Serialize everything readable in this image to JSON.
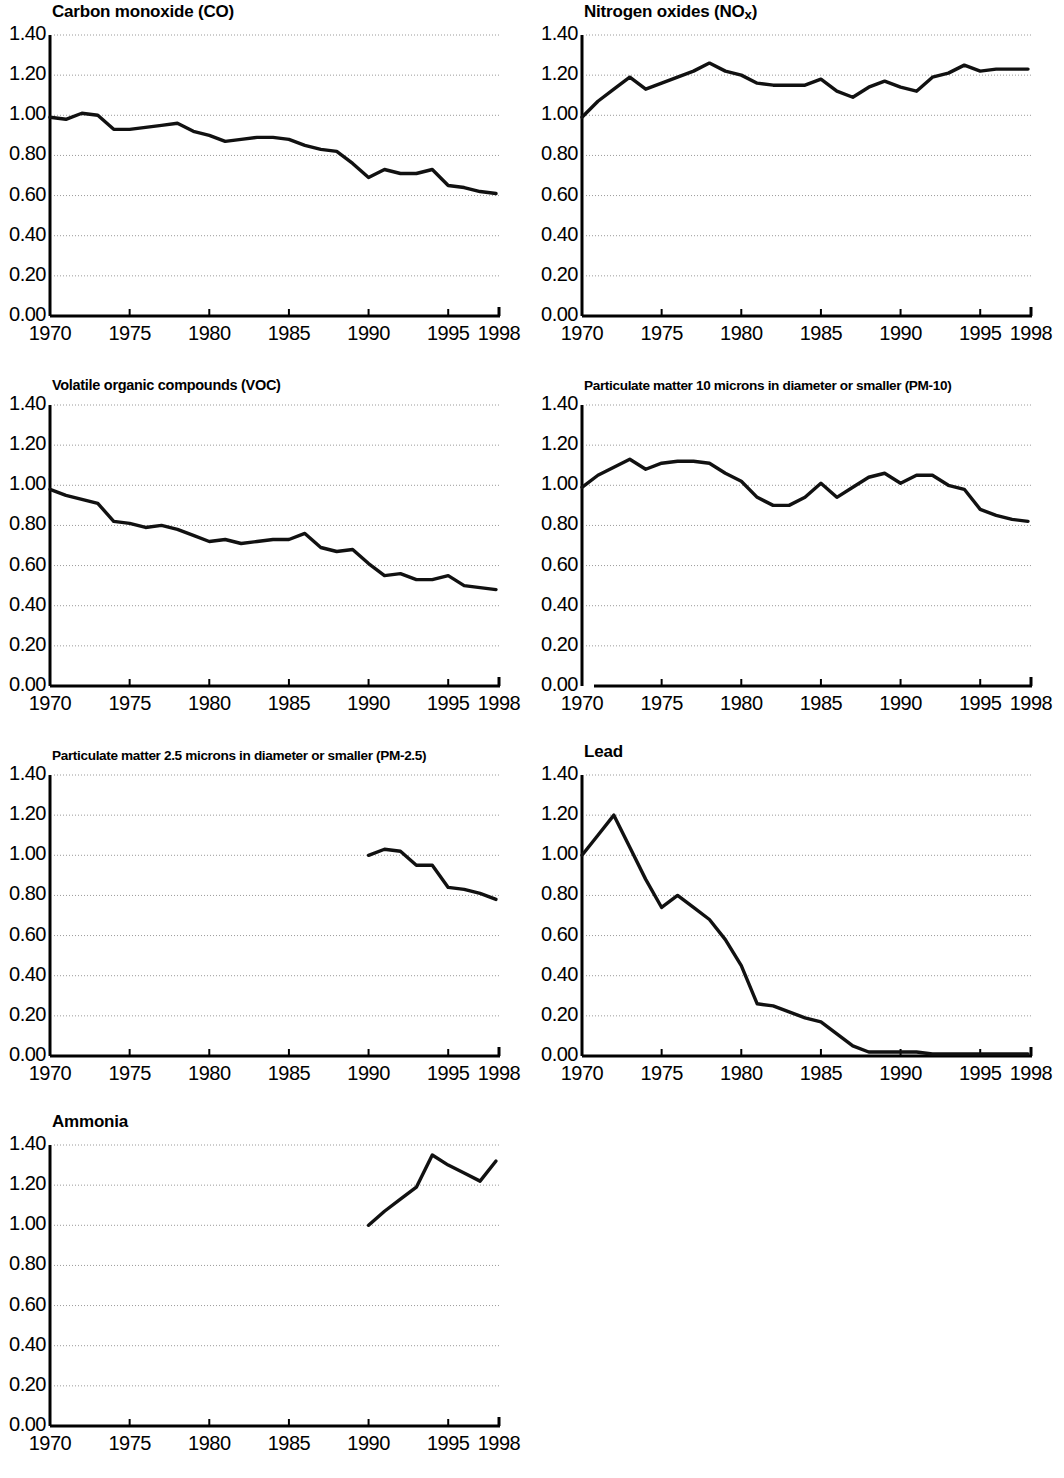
{
  "figure": {
    "panel_count": 7,
    "columns": 2,
    "line_color": "#111111",
    "grid_color": "#9a9a9a",
    "axis_color": "#000000",
    "background": "#ffffff"
  },
  "axis": {
    "ytick_labels": [
      "1.40",
      "1.20",
      "1.00",
      "0.80",
      "0.60",
      "0.40",
      "0.20",
      "0.00"
    ],
    "ytick_values": [
      1.4,
      1.2,
      1.0,
      0.8,
      0.6,
      0.4,
      0.2,
      0.0
    ],
    "xtick_labels": [
      "1970",
      "1975",
      "1980",
      "1985",
      "1990",
      "1995",
      "1998"
    ],
    "xtick_values": [
      1970,
      1975,
      1980,
      1985,
      1990,
      1995,
      1998
    ],
    "xlim": [
      1970,
      1998
    ],
    "ylim": [
      0.0,
      1.4
    ]
  },
  "chart_data": [
    {
      "type": "line",
      "title": "Carbon monoxide (CO)",
      "title_html": "Carbon monoxide (CO)",
      "xlabel": "",
      "ylabel": "",
      "xlim": [
        1970,
        1998
      ],
      "ylim": [
        0.0,
        1.4
      ],
      "grid": true,
      "legend": "none",
      "x": [
        1970,
        1971,
        1972,
        1973,
        1974,
        1975,
        1976,
        1977,
        1978,
        1979,
        1980,
        1981,
        1982,
        1983,
        1984,
        1985,
        1986,
        1987,
        1988,
        1989,
        1990,
        1991,
        1992,
        1993,
        1994,
        1995,
        1996,
        1997,
        1998
      ],
      "values": [
        0.99,
        0.98,
        1.01,
        1.0,
        0.93,
        0.93,
        0.94,
        0.95,
        0.96,
        0.92,
        0.9,
        0.87,
        0.88,
        0.89,
        0.89,
        0.88,
        0.85,
        0.83,
        0.82,
        0.76,
        0.69,
        0.73,
        0.71,
        0.71,
        0.73,
        0.65,
        0.64,
        0.62,
        0.61
      ]
    },
    {
      "type": "line",
      "title": "Nitrogen oxides (NOx)",
      "title_html": "Nitrogen oxides (NO<sub>x</sub>)",
      "xlabel": "",
      "ylabel": "",
      "xlim": [
        1970,
        1998
      ],
      "ylim": [
        0.0,
        1.4
      ],
      "grid": true,
      "legend": "none",
      "x": [
        1970,
        1971,
        1972,
        1973,
        1974,
        1975,
        1976,
        1977,
        1978,
        1979,
        1980,
        1981,
        1982,
        1983,
        1984,
        1985,
        1986,
        1987,
        1988,
        1989,
        1990,
        1991,
        1992,
        1993,
        1994,
        1995,
        1996,
        1997,
        1998
      ],
      "values": [
        0.99,
        1.07,
        1.13,
        1.19,
        1.13,
        1.16,
        1.19,
        1.22,
        1.26,
        1.22,
        1.2,
        1.16,
        1.15,
        1.15,
        1.15,
        1.18,
        1.12,
        1.09,
        1.14,
        1.17,
        1.14,
        1.12,
        1.19,
        1.21,
        1.25,
        1.22,
        1.23,
        1.23,
        1.23
      ]
    },
    {
      "type": "line",
      "title": "Volatile organic compounds (VOC)",
      "title_html": "Volatile organic compounds (VOC)",
      "xlabel": "",
      "ylabel": "",
      "xlim": [
        1970,
        1998
      ],
      "ylim": [
        0.0,
        1.4
      ],
      "grid": true,
      "legend": "none",
      "x": [
        1970,
        1971,
        1972,
        1973,
        1974,
        1975,
        1976,
        1977,
        1978,
        1979,
        1980,
        1981,
        1982,
        1983,
        1984,
        1985,
        1986,
        1987,
        1988,
        1989,
        1990,
        1991,
        1992,
        1993,
        1994,
        1995,
        1996,
        1997,
        1998
      ],
      "values": [
        0.98,
        0.95,
        0.93,
        0.91,
        0.82,
        0.81,
        0.79,
        0.8,
        0.78,
        0.75,
        0.72,
        0.73,
        0.71,
        0.72,
        0.73,
        0.73,
        0.76,
        0.69,
        0.67,
        0.68,
        0.61,
        0.55,
        0.56,
        0.53,
        0.53,
        0.55,
        0.5,
        0.49,
        0.48
      ]
    },
    {
      "type": "line",
      "title": "Particulate matter 10 microns in diameter or smaller (PM-10)",
      "title_html": "Particulate matter 10 microns in diameter or smaller (PM-10)",
      "xlabel": "",
      "ylabel": "",
      "xlim": [
        1970,
        1998
      ],
      "ylim": [
        0.0,
        1.4
      ],
      "grid": true,
      "legend": "none",
      "axis_gap": true,
      "x": [
        1970,
        1971,
        1972,
        1973,
        1974,
        1975,
        1976,
        1977,
        1978,
        1979,
        1980,
        1981,
        1982,
        1983,
        1984,
        1985,
        1986,
        1987,
        1988,
        1989,
        1990,
        1991,
        1992,
        1993,
        1994,
        1995,
        1996,
        1997,
        1998
      ],
      "values": [
        0.99,
        1.05,
        1.09,
        1.13,
        1.08,
        1.11,
        1.12,
        1.12,
        1.11,
        1.06,
        1.02,
        0.94,
        0.9,
        0.9,
        0.94,
        1.01,
        0.94,
        0.99,
        1.04,
        1.06,
        1.01,
        1.05,
        1.05,
        1.0,
        0.98,
        0.88,
        0.85,
        0.83,
        0.82
      ]
    },
    {
      "type": "line",
      "title": "Particulate matter 2.5 microns in diameter or smaller (PM-2.5)",
      "title_html": "Particulate matter 2.5 microns in diameter or smaller (PM-2.5)",
      "xlabel": "",
      "ylabel": "",
      "xlim": [
        1970,
        1998
      ],
      "ylim": [
        0.0,
        1.4
      ],
      "grid": true,
      "legend": "none",
      "note": "data begins 1990",
      "x": [
        1990,
        1991,
        1992,
        1993,
        1994,
        1995,
        1996,
        1997,
        1998
      ],
      "values": [
        1.0,
        1.03,
        1.02,
        0.95,
        0.95,
        0.84,
        0.83,
        0.81,
        0.78
      ]
    },
    {
      "type": "line",
      "title": "Lead",
      "title_html": "Lead",
      "xlabel": "",
      "ylabel": "",
      "xlim": [
        1970,
        1998
      ],
      "ylim": [
        0.0,
        1.4
      ],
      "grid": true,
      "legend": "none",
      "x": [
        1970,
        1971,
        1972,
        1973,
        1974,
        1975,
        1976,
        1977,
        1978,
        1979,
        1980,
        1981,
        1982,
        1983,
        1984,
        1985,
        1986,
        1987,
        1988,
        1989,
        1990,
        1991,
        1992,
        1993,
        1994,
        1995,
        1996,
        1997,
        1998
      ],
      "values": [
        1.0,
        1.1,
        1.2,
        1.04,
        0.88,
        0.74,
        0.8,
        0.74,
        0.68,
        0.58,
        0.45,
        0.26,
        0.25,
        0.22,
        0.19,
        0.17,
        0.11,
        0.05,
        0.02,
        0.02,
        0.02,
        0.02,
        0.01,
        0.01,
        0.01,
        0.01,
        0.01,
        0.01,
        0.01
      ]
    },
    {
      "type": "line",
      "title": "Ammonia",
      "title_html": "Ammonia",
      "xlabel": "",
      "ylabel": "",
      "xlim": [
        1970,
        1998
      ],
      "ylim": [
        0.0,
        1.4
      ],
      "grid": true,
      "legend": "none",
      "note": "data begins 1990",
      "x": [
        1990,
        1991,
        1992,
        1993,
        1994,
        1995,
        1996,
        1997,
        1998
      ],
      "values": [
        1.0,
        1.07,
        1.13,
        1.19,
        1.35,
        1.3,
        1.26,
        1.22,
        1.32
      ]
    }
  ]
}
